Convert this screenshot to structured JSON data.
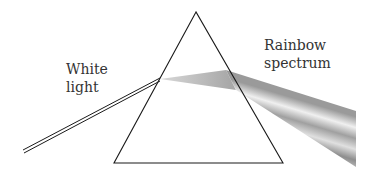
{
  "diagram": {
    "labels": {
      "white_light": [
        "White",
        "light"
      ],
      "rainbow": [
        "Rainbow",
        "spectrum"
      ]
    },
    "prism": {
      "apex": [
        196,
        12
      ],
      "base_left": [
        114,
        163
      ],
      "base_right": [
        283,
        163
      ]
    },
    "incident_ray": {
      "from": [
        23,
        152
      ],
      "to": [
        160,
        79
      ]
    },
    "spectrum_beam": {
      "entry": [
        160,
        79
      ],
      "exit_top": [
        226,
        70
      ],
      "exit_bottom": [
        236,
        90
      ],
      "end_top": [
        356,
        111
      ],
      "end_bottom": [
        356,
        167
      ]
    },
    "colors": {
      "stroke": "#1a1a1a",
      "text": "#333333",
      "beam_light": "#e8e8e8",
      "beam_dark": "#8a8a8a"
    }
  }
}
